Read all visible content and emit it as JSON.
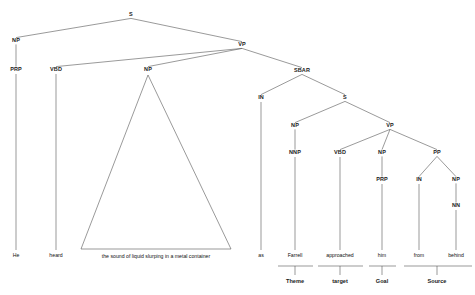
{
  "figure": {
    "caption_top": ""
  },
  "tree": {
    "nodes": [
      {
        "id": "S-root",
        "label": "S",
        "x": 131,
        "y": 15
      },
      {
        "id": "NP-subj",
        "label": "NP",
        "x": 16,
        "y": 41
      },
      {
        "id": "VP-main",
        "label": "VP",
        "x": 242,
        "y": 45
      },
      {
        "id": "PRP-he",
        "label": "PRP",
        "x": 16,
        "y": 70
      },
      {
        "id": "VBD-heard",
        "label": "VBD",
        "x": 56,
        "y": 70
      },
      {
        "id": "NP-obj",
        "label": "NP",
        "x": 148,
        "y": 70
      },
      {
        "id": "SBAR",
        "label": "SBAR",
        "x": 302,
        "y": 71
      },
      {
        "id": "IN-as",
        "label": "IN",
        "x": 261,
        "y": 98
      },
      {
        "id": "S-sub",
        "label": "S",
        "x": 345,
        "y": 98
      },
      {
        "id": "NP-farrell",
        "label": "NP",
        "x": 295,
        "y": 126
      },
      {
        "id": "VP-sub",
        "label": "VP",
        "x": 390,
        "y": 126
      },
      {
        "id": "NNP",
        "label": "NNP",
        "x": 295,
        "y": 153
      },
      {
        "id": "VBD-appr",
        "label": "VBD",
        "x": 340,
        "y": 153
      },
      {
        "id": "NP-him",
        "label": "NP",
        "x": 382,
        "y": 153
      },
      {
        "id": "PP",
        "label": "PP",
        "x": 437,
        "y": 153
      },
      {
        "id": "PRP-him",
        "label": "PRP",
        "x": 382,
        "y": 180
      },
      {
        "id": "IN-from",
        "label": "IN",
        "x": 419,
        "y": 180
      },
      {
        "id": "NP-behind",
        "label": "NP",
        "x": 456,
        "y": 180
      },
      {
        "id": "NN",
        "label": "NN",
        "x": 456,
        "y": 206
      }
    ],
    "terminals": [
      {
        "id": "t-he",
        "text": "He",
        "x": 16,
        "y": 256
      },
      {
        "id": "t-heard",
        "text": "heard",
        "x": 56,
        "y": 256
      },
      {
        "id": "t-phrase",
        "text": "the sound of liquid slurping in a metal container",
        "x": 156,
        "y": 257
      },
      {
        "id": "t-as",
        "text": "as",
        "x": 261,
        "y": 256
      },
      {
        "id": "t-farrell",
        "text": "Farrell",
        "x": 295,
        "y": 256
      },
      {
        "id": "t-approached",
        "text": "approached",
        "x": 340,
        "y": 256
      },
      {
        "id": "t-him",
        "text": "him",
        "x": 382,
        "y": 256
      },
      {
        "id": "t-from",
        "text": "from",
        "x": 419,
        "y": 256
      },
      {
        "id": "t-behind",
        "text": "behind",
        "x": 456,
        "y": 256
      }
    ],
    "roles": [
      {
        "id": "r-theme",
        "label": "Theme",
        "x": 295,
        "y": 282,
        "span_x1": 278,
        "span_x2": 313,
        "tick_x": 295
      },
      {
        "id": "r-target",
        "label": "target",
        "x": 340,
        "y": 282,
        "span_x1": 318,
        "span_x2": 363,
        "tick_x": 340
      },
      {
        "id": "r-goal",
        "label": "Goal",
        "x": 382,
        "y": 282,
        "span_x1": 369,
        "span_x2": 396,
        "tick_x": 382
      },
      {
        "id": "r-source",
        "label": "Source",
        "x": 437,
        "y": 282,
        "span_x1": 404,
        "span_x2": 472,
        "tick_x": 437
      }
    ],
    "edges": [
      {
        "from": "S-root",
        "to": "NP-subj"
      },
      {
        "from": "S-root",
        "to": "VP-main"
      },
      {
        "from": "NP-subj",
        "to": "PRP-he"
      },
      {
        "from": "VP-main",
        "to": "VBD-heard"
      },
      {
        "from": "VP-main",
        "to": "NP-obj"
      },
      {
        "from": "VP-main",
        "to": "SBAR"
      },
      {
        "from": "SBAR",
        "to": "IN-as"
      },
      {
        "from": "SBAR",
        "to": "S-sub"
      },
      {
        "from": "S-sub",
        "to": "NP-farrell"
      },
      {
        "from": "S-sub",
        "to": "VP-sub"
      },
      {
        "from": "NP-farrell",
        "to": "NNP"
      },
      {
        "from": "VP-sub",
        "to": "VBD-appr"
      },
      {
        "from": "VP-sub",
        "to": "NP-him"
      },
      {
        "from": "VP-sub",
        "to": "PP"
      },
      {
        "from": "NP-him",
        "to": "PRP-him"
      },
      {
        "from": "PP",
        "to": "IN-from"
      },
      {
        "from": "PP",
        "to": "NP-behind"
      },
      {
        "from": "NP-behind",
        "to": "NN"
      }
    ],
    "stems": [
      {
        "id": "stem-he",
        "x": 16,
        "y1": 74,
        "y2": 250
      },
      {
        "id": "stem-heard",
        "x": 56,
        "y1": 74,
        "y2": 250
      },
      {
        "id": "stem-as",
        "x": 261,
        "y1": 102,
        "y2": 250
      },
      {
        "id": "stem-farrell",
        "x": 295,
        "y1": 157,
        "y2": 250
      },
      {
        "id": "stem-approached",
        "x": 340,
        "y1": 157,
        "y2": 250
      },
      {
        "id": "stem-him",
        "x": 382,
        "y1": 184,
        "y2": 250
      },
      {
        "id": "stem-from",
        "x": 419,
        "y1": 184,
        "y2": 250
      },
      {
        "id": "stem-behind",
        "x": 456,
        "y1": 210,
        "y2": 250
      }
    ],
    "triangle": {
      "id": "np-triangle",
      "apex_x": 148,
      "apex_y": 75,
      "left_x": 81,
      "right_x": 231,
      "base_y": 249
    },
    "colors": {
      "line": "#555555",
      "text": "#111111",
      "background": "#ffffff"
    }
  }
}
